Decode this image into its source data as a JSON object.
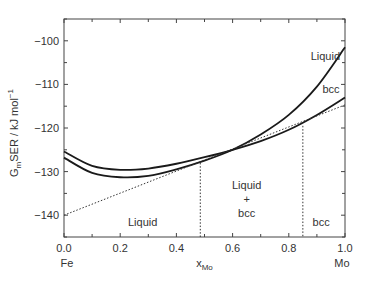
{
  "chart_data": {
    "type": "line",
    "title": "",
    "xlabel": "x_Mo",
    "xlabel_main": "x",
    "xlabel_sub": "Mo",
    "ylabel": "G_m SER / kJ mol^-1",
    "ylabel_parts": {
      "g": "G",
      "sub": "m",
      "rest": "SER / kJ mol",
      "sup": "−1"
    },
    "xlim": [
      0.0,
      1.0
    ],
    "ylim": [
      -145,
      -95
    ],
    "x_ticks": [
      0.0,
      0.2,
      0.4,
      0.6,
      0.8,
      1.0
    ],
    "x_tick_labels": [
      "0.0",
      "0.2",
      "0.4",
      "0.6",
      "0.8",
      "1.0"
    ],
    "x_minor_step": 0.1,
    "y_ticks": [
      -100,
      -110,
      -120,
      -130,
      -140
    ],
    "y_tick_labels": [
      "−100",
      "−110",
      "−120",
      "−130",
      "−140"
    ],
    "y_minor_step": 5,
    "x_end_labels": {
      "left": "Fe",
      "right": "Mo"
    },
    "grid": false,
    "series": [
      {
        "name": "Liquid",
        "style": "solid",
        "x": [
          0.0,
          0.1,
          0.2,
          0.3,
          0.4,
          0.5,
          0.6,
          0.7,
          0.8,
          0.9,
          1.0
        ],
        "y": [
          -126.8,
          -130.3,
          -131.3,
          -131.0,
          -129.5,
          -127.5,
          -125.0,
          -121.5,
          -117.0,
          -110.5,
          -101.5
        ]
      },
      {
        "name": "bcc",
        "style": "solid",
        "x": [
          0.0,
          0.1,
          0.2,
          0.3,
          0.4,
          0.5,
          0.6,
          0.7,
          0.8,
          0.9,
          1.0
        ],
        "y": [
          -125.4,
          -128.7,
          -129.6,
          -129.3,
          -128.2,
          -126.7,
          -125.0,
          -123.0,
          -120.4,
          -117.0,
          -113.0
        ]
      },
      {
        "name": "Common tangent",
        "style": "dotted",
        "x": [
          0.0,
          1.0
        ],
        "y": [
          -140.0,
          -114.7
        ]
      }
    ],
    "phase_boundaries": [
      {
        "x": 0.485,
        "y_top": -128.0,
        "style": "dotted"
      },
      {
        "x": 0.85,
        "y_top": -119.5,
        "style": "dotted"
      }
    ],
    "annotations": [
      {
        "text": "Liquid",
        "x": 0.93,
        "y": -104.5,
        "kind": "curve-label"
      },
      {
        "text": "bcc",
        "x": 0.95,
        "y": -112.0,
        "kind": "curve-label"
      },
      {
        "text": "Liquid",
        "x": 0.28,
        "y": -142.5,
        "kind": "region-label"
      },
      {
        "text": "Liquid",
        "x": 0.65,
        "y": -134.0,
        "kind": "region-label"
      },
      {
        "text": "+",
        "x": 0.65,
        "y": -137.3,
        "kind": "region-label"
      },
      {
        "text": "bcc",
        "x": 0.65,
        "y": -140.5,
        "kind": "region-label"
      },
      {
        "text": "bcc",
        "x": 0.915,
        "y": -142.5,
        "kind": "region-label"
      }
    ]
  },
  "colors": {
    "axis": "#444444",
    "curve": "#1a1a1a",
    "dotted": "#333333",
    "text": "#333333"
  }
}
